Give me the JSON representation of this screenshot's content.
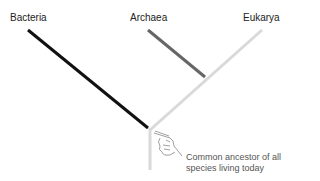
{
  "domains": [
    {
      "name": "Bacteria",
      "color": "#111111"
    },
    {
      "name": "Archaea",
      "color": "#666666"
    },
    {
      "name": "Eukarya",
      "color": "#d9d9d9"
    }
  ],
  "annotation": {
    "line1": "Common ancestor of all",
    "line2": "species living today",
    "icon": "pointing-hand-icon"
  }
}
